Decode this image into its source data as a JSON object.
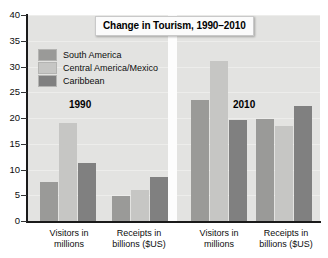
{
  "chart_data": {
    "type": "bar",
    "title": "Change in Tourism, 1990–2010",
    "xlabel": "",
    "ylabel": "",
    "ylim": [
      0,
      40
    ],
    "ytick_step": 5,
    "yticks": [
      "0",
      "5",
      "10",
      "15",
      "20",
      "25",
      "30",
      "35",
      "40"
    ],
    "grid": true,
    "legend_position": "upper-left-inside",
    "categories": [
      "Visitors in millions",
      "Receipts in billions ($US)",
      "Visitors in millions",
      "Receipts in billions ($US)"
    ],
    "panels": [
      {
        "year": "1990",
        "groups": [
          {
            "label_line1": "Visitors in",
            "label_line2": "millions",
            "values": [
              7.5,
              19.0,
              11.2
            ]
          },
          {
            "label_line1": "Receipts in",
            "label_line2": "billions ($US)",
            "values": [
              4.8,
              6.0,
              8.5
            ]
          }
        ]
      },
      {
        "year": "2010",
        "groups": [
          {
            "label_line1": "Visitors in",
            "label_line2": "millions",
            "values": [
              23.5,
              31.0,
              19.6
            ]
          },
          {
            "label_line1": "Receipts in",
            "label_line2": "billions ($US)",
            "values": [
              19.8,
              18.4,
              22.3
            ]
          }
        ]
      }
    ],
    "series": [
      {
        "name": "South America",
        "color": "#9a9a98",
        "values": [
          7.5,
          4.8,
          23.5,
          19.8
        ]
      },
      {
        "name": "Central America/Mexico",
        "color": "#c6c6c4",
        "values": [
          19.0,
          6.0,
          31.0,
          18.4
        ]
      },
      {
        "name": "Caribbean",
        "color": "#808080",
        "values": [
          11.2,
          8.5,
          19.6,
          22.3
        ]
      }
    ]
  },
  "legend": {
    "items": [
      {
        "label": "South America",
        "color": "#9a9a98"
      },
      {
        "label": "Central America/Mexico",
        "color": "#c6c6c4"
      },
      {
        "label": "Caribbean",
        "color": "#808080"
      }
    ]
  },
  "annotations": {
    "year_1990": "1990",
    "year_2010": "2010"
  },
  "colors": {
    "plot_background": "#e3e3e1",
    "page_background": "#ffffff",
    "axis": "#1a1a1a",
    "gridline": "#ededeb",
    "divider": "#fdfdfd",
    "title_box_background": "#fbfbfb",
    "title_box_border": "#c9c9c9",
    "text": "#0d0d0d"
  }
}
